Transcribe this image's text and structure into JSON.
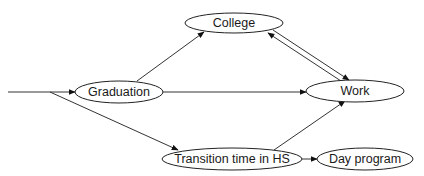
{
  "diagram": {
    "type": "flowchart",
    "nodes": [
      {
        "id": "graduation",
        "label": "Graduation",
        "cx": 119,
        "cy": 92,
        "rx": 44,
        "ry": 11
      },
      {
        "id": "college",
        "label": "College",
        "cx": 234,
        "cy": 23,
        "rx": 49,
        "ry": 10
      },
      {
        "id": "work",
        "label": "Work",
        "cx": 355,
        "cy": 91,
        "rx": 49,
        "ry": 11
      },
      {
        "id": "transition",
        "label": "Transition time in HS",
        "cx": 232,
        "cy": 159,
        "rx": 70,
        "ry": 11
      },
      {
        "id": "day_program",
        "label": "Day program",
        "cx": 365,
        "cy": 159,
        "rx": 48,
        "ry": 11
      }
    ],
    "edges": [
      {
        "from": "entry",
        "to": "graduation"
      },
      {
        "from": "entry",
        "to": "transition"
      },
      {
        "from": "graduation",
        "to": "college"
      },
      {
        "from": "graduation",
        "to": "work"
      },
      {
        "from": "college",
        "to": "work"
      },
      {
        "from": "work",
        "to": "college"
      },
      {
        "from": "transition",
        "to": "work"
      },
      {
        "from": "transition",
        "to": "day_program"
      }
    ]
  },
  "labels": {
    "graduation": "Graduation",
    "college": "College",
    "work": "Work",
    "transition": "Transition time in HS",
    "day_program": "Day program"
  }
}
